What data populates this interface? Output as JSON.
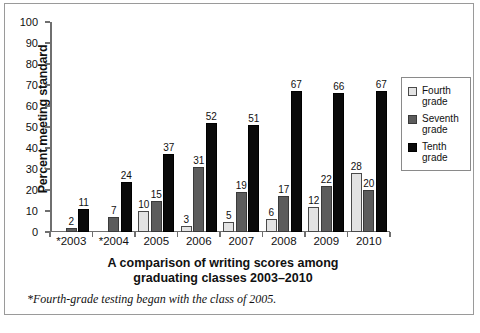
{
  "chart_data": {
    "type": "bar",
    "title": "A comparison of writing scores among graduating classes 2003–2010",
    "title_line1": "A comparison of writing scores among",
    "title_line2": "graduating classes 2003–2010",
    "xlabel": "",
    "ylabel": "Percent meeting standard",
    "ylim": [
      0,
      100
    ],
    "ytick_step": 10,
    "yticks": [
      0,
      10,
      20,
      30,
      40,
      50,
      60,
      70,
      80,
      90,
      100
    ],
    "grid": false,
    "legend_position": "right",
    "categories": [
      "*2003",
      "*2004",
      "2005",
      "2006",
      "2007",
      "2008",
      "2009",
      "2010"
    ],
    "series": [
      {
        "name": "Fourth grade",
        "color": "#e3e3e3",
        "values": [
          null,
          null,
          10,
          3,
          5,
          6,
          12,
          28
        ]
      },
      {
        "name": "Seventh grade",
        "color": "#5c5c5c",
        "values": [
          2,
          7,
          15,
          31,
          19,
          17,
          22,
          20
        ]
      },
      {
        "name": "Tenth grade",
        "color": "#0a0a0a",
        "values": [
          11,
          24,
          37,
          52,
          51,
          67,
          66,
          67
        ]
      }
    ],
    "annotations": [
      "*Fourth-grade testing began with the class of 2005."
    ]
  },
  "legend": {
    "items": [
      {
        "label_line1": "Fourth",
        "label_line2": "grade",
        "swatch": "light-gray-swatch"
      },
      {
        "label_line1": "Seventh",
        "label_line2": "grade",
        "swatch": "dark-gray-swatch"
      },
      {
        "label_line1": "Tenth",
        "label_line2": "grade",
        "swatch": "black-swatch"
      }
    ]
  },
  "footnote": "*Fourth-grade testing began with the class of 2005.",
  "caption": ""
}
